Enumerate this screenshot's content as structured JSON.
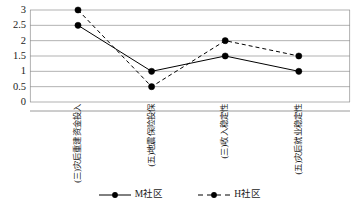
{
  "chart_data": {
    "type": "line",
    "title": "",
    "subtitle": "",
    "xlabel": "",
    "ylabel": "",
    "ylim": [
      0,
      3
    ],
    "yticks": [
      "0",
      "0.5",
      "1",
      "1.5",
      "2",
      "2.5",
      "3"
    ],
    "ytick_values": [
      0,
      0.5,
      1,
      1.5,
      2,
      2.5,
      3
    ],
    "grid": true,
    "grid_axis": "y",
    "legend_position": "bottom-center",
    "categories": [
      "(三)灾后重建资金投入",
      "(五)地震保险投保",
      "(三)收入稳定性",
      "(五)灾后就业稳定性"
    ],
    "series": [
      {
        "name": "M社区",
        "linestyle": "solid",
        "marker": "filled-circle",
        "color": "#000000",
        "values": [
          2.5,
          1,
          1.5,
          1
        ]
      },
      {
        "name": "H社区",
        "linestyle": "dashed",
        "marker": "filled-circle",
        "color": "#000000",
        "values": [
          3,
          0.5,
          2,
          1.5
        ]
      }
    ]
  },
  "legend": {
    "entries": [
      {
        "label": "M社区",
        "style": "solid"
      },
      {
        "label": "H社区",
        "style": "dashed"
      }
    ]
  }
}
